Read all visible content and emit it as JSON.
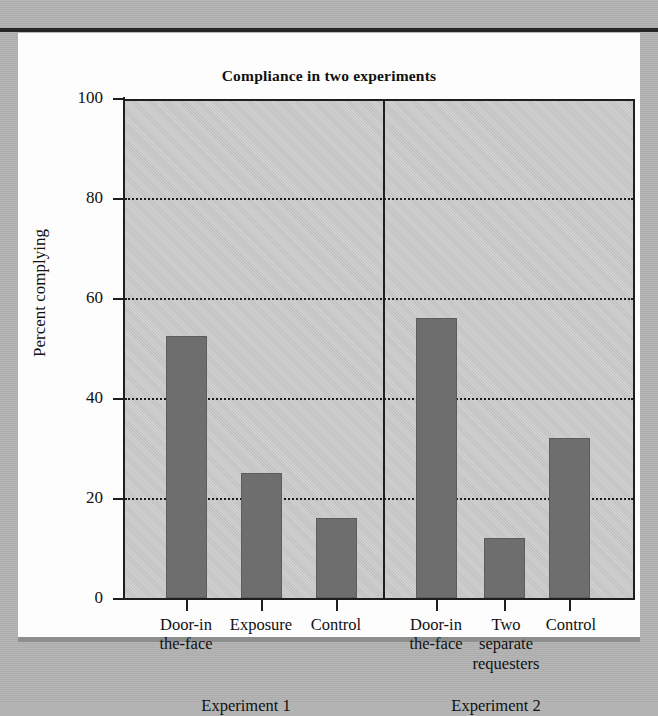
{
  "figure": {
    "title": "Compliance in two experiments"
  },
  "chart_data": {
    "type": "bar",
    "title": "Compliance in two experiments",
    "xlabel": "",
    "ylabel": "Percent complying",
    "ylim": [
      0,
      100
    ],
    "yticks": [
      0,
      20,
      40,
      60,
      80,
      100
    ],
    "ytick_labels": [
      "0",
      "20",
      "40",
      "60",
      "80",
      "100"
    ],
    "gridlines": [
      20,
      40,
      60,
      80
    ],
    "grid": "horizontal-dotted",
    "legend": "none",
    "groups": [
      {
        "name": "Experiment 1",
        "categories": [
          "Door-in the-face",
          "Exposure",
          "Control"
        ],
        "category_lines": [
          [
            "Door-in",
            "the-face"
          ],
          [
            "Exposure"
          ],
          [
            "Control"
          ]
        ],
        "values": [
          52.5,
          25,
          16
        ]
      },
      {
        "name": "Experiment 2",
        "categories": [
          "Door-in the-face",
          "Two separate requesters",
          "Control"
        ],
        "category_lines": [
          [
            "Door-in",
            "the-face"
          ],
          [
            "Two",
            "separate",
            "requesters"
          ],
          [
            "Control"
          ]
        ],
        "values": [
          56,
          12,
          32
        ]
      }
    ],
    "bar_color": "#6e6e6e",
    "plot_background": "#c6c6c6"
  },
  "axis": {
    "y_title": "Percent complying",
    "ticks": [
      {
        "label": "100",
        "value": 100
      },
      {
        "label": "80",
        "value": 80
      },
      {
        "label": "60",
        "value": 60
      },
      {
        "label": "40",
        "value": 40
      },
      {
        "label": "20",
        "value": 20
      },
      {
        "label": "0",
        "value": 0
      }
    ]
  },
  "categories": [
    {
      "line1": "Door-in",
      "line2": "the-face",
      "line3": ""
    },
    {
      "line1": "Exposure",
      "line2": "",
      "line3": ""
    },
    {
      "line1": "Control",
      "line2": "",
      "line3": ""
    },
    {
      "line1": "Door-in",
      "line2": "the-face",
      "line3": ""
    },
    {
      "line1": "Two",
      "line2": "separate",
      "line3": "requesters"
    },
    {
      "line1": "Control",
      "line2": "",
      "line3": ""
    }
  ],
  "groups": [
    {
      "label": "Experiment 1"
    },
    {
      "label": "Experiment 2"
    }
  ]
}
